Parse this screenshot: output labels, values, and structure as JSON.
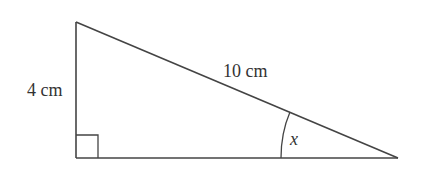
{
  "diagram": {
    "type": "right-triangle",
    "stroke_color": "#444444",
    "vertices": {
      "top": [
        76,
        22
      ],
      "right_angle": [
        76,
        158
      ],
      "acute": [
        398,
        158
      ]
    },
    "labels": {
      "vertical_side": "4 cm",
      "hypotenuse": "10 cm",
      "angle": "x"
    },
    "right_angle_marker": true
  }
}
